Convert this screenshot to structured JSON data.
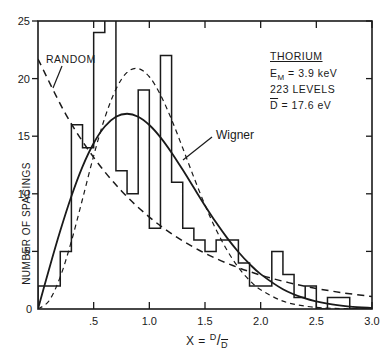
{
  "chart_data": {
    "type": "bar",
    "title": "",
    "xlabel": "X = D/D̄",
    "ylabel": "NUMBER OF SPACINGS",
    "xlim": [
      0,
      3.0
    ],
    "ylim": [
      0,
      25
    ],
    "grid": false,
    "x_ticks": [
      ".5",
      "1.0",
      "1.5",
      "2.0",
      "2.5",
      "3.0"
    ],
    "x_tick_values": [
      0.5,
      1.0,
      1.5,
      2.0,
      2.5,
      3.0
    ],
    "y_ticks": [
      "0",
      "5",
      "10",
      "15",
      "20",
      "25"
    ],
    "y_tick_values": [
      0,
      5,
      10,
      15,
      20,
      25
    ],
    "histogram": {
      "name": "Observed spacings (Thorium)",
      "bin_edges": [
        0.0,
        0.2,
        0.3,
        0.4,
        0.5,
        0.6,
        0.7,
        0.8,
        0.9,
        1.0,
        1.1,
        1.2,
        1.3,
        1.4,
        1.5,
        1.6,
        1.8,
        1.9,
        2.1,
        2.2,
        2.3,
        2.4,
        2.5,
        2.6,
        2.8,
        3.0
      ],
      "counts": [
        2,
        5,
        16,
        14,
        24,
        26,
        12,
        10,
        19,
        7,
        22,
        11,
        7,
        6,
        5,
        6,
        4,
        2,
        5,
        3,
        1,
        2,
        0,
        1,
        0
      ],
      "notes": "bin 0.6-0.7 extends beyond the top of the plot (>25)"
    },
    "series": [
      {
        "name": "Wigner",
        "style": "solid",
        "x": [
          0,
          0.1,
          0.2,
          0.3,
          0.4,
          0.5,
          0.6,
          0.7,
          0.8,
          0.9,
          1.0,
          1.1,
          1.2,
          1.3,
          1.4,
          1.5,
          1.6,
          1.7,
          1.8,
          1.9,
          2.0,
          2.2,
          2.4,
          2.6,
          2.8,
          3.0
        ],
        "values": [
          0,
          3.48,
          6.79,
          9.79,
          12.36,
          14.39,
          15.84,
          16.69,
          16.95,
          16.69,
          15.97,
          14.9,
          13.57,
          12.08,
          10.52,
          8.97,
          7.5,
          6.15,
          4.95,
          3.91,
          3.03,
          1.72,
          0.92,
          0.46,
          0.21,
          0.09
        ]
      },
      {
        "name": "RANDOM",
        "style": "dashed",
        "x": [
          0,
          0.25,
          0.5,
          0.75,
          1.0,
          1.25,
          1.5,
          1.75,
          2.0,
          2.25,
          2.5,
          2.75,
          3.0
        ],
        "values": [
          21.7,
          16.9,
          13.16,
          10.25,
          7.98,
          6.22,
          4.84,
          3.77,
          2.94,
          2.29,
          1.78,
          1.39,
          1.08
        ]
      },
      {
        "name": "Peaked (fine dashed)",
        "style": "dashed-fine",
        "x": [
          0,
          0.1,
          0.2,
          0.3,
          0.4,
          0.5,
          0.6,
          0.7,
          0.8,
          0.9,
          1.0,
          1.1,
          1.2,
          1.3,
          1.4,
          1.5,
          1.6,
          1.7,
          1.8,
          1.9,
          2.0,
          2.2,
          2.4,
          2.6,
          2.8,
          3.0
        ],
        "values": [
          0,
          0.72,
          2.79,
          5.88,
          9.55,
          13.3,
          16.59,
          19.08,
          20.54,
          20.87,
          20.16,
          18.59,
          16.44,
          13.97,
          11.43,
          9.02,
          6.88,
          5.07,
          3.61,
          2.49,
          1.67,
          0.68,
          0.25,
          0.08,
          0.02,
          0
        ]
      }
    ],
    "annotations": {
      "random_label": "RANDOM",
      "wigner_label": "Wigner",
      "element": "THORIUM",
      "em_label": "E",
      "em_sub": "M",
      "em_value": " = 3.9 keV",
      "levels": "223 LEVELS",
      "dbar_label": "D",
      "dbar_value": " = 17.6 eV"
    },
    "xaxis_label": {
      "prefix": "X = ",
      "numerator": "D",
      "slash": "/",
      "denominator": "D"
    },
    "legend": "none (inline labels)"
  }
}
